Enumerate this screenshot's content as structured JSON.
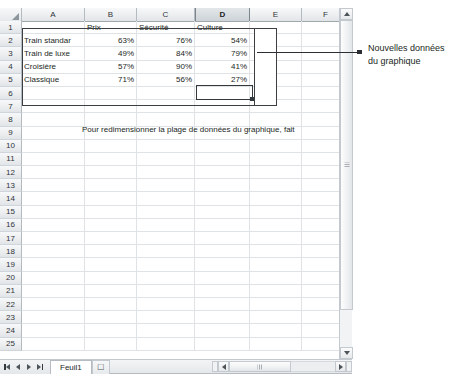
{
  "app": {
    "name": "Microsoft Excel worksheet"
  },
  "grid": {
    "column_headers": [
      "A",
      "B",
      "C",
      "D",
      "E",
      "F"
    ],
    "selected_column": "D",
    "row_headers": [
      "1",
      "2",
      "3",
      "4",
      "5",
      "6",
      "7",
      "8",
      "9",
      "10",
      "11",
      "12",
      "13",
      "14",
      "15",
      "16",
      "17",
      "18",
      "19",
      "20",
      "21",
      "22",
      "23",
      "24",
      "25"
    ],
    "header_row": {
      "A": "",
      "B": "Prix",
      "C": "Sécurité",
      "D": "Culture",
      "E": "",
      "F": ""
    },
    "rows": [
      {
        "row": "2",
        "A": "Train standar",
        "B": "63%",
        "C": "76%",
        "D": "54%"
      },
      {
        "row": "3",
        "A": "Train de luxe",
        "B": "49%",
        "C": "84%",
        "D": "79%"
      },
      {
        "row": "4",
        "A": "Croisière",
        "B": "57%",
        "C": "90%",
        "D": "41%"
      },
      {
        "row": "5",
        "A": "Classique",
        "B": "71%",
        "C": "56%",
        "D": "27%"
      }
    ],
    "active_cell": "D5",
    "active_cell_value": "27%",
    "hint_text": "Pour redimensionner la plage de données du graphique, fait"
  },
  "tabbar": {
    "sheet_name": "Feuil1",
    "new_sheet_icon": "new-sheet-icon",
    "nav_first_icon": "nav-first-icon",
    "nav_prev_icon": "nav-prev-icon",
    "nav_next_icon": "nav-next-icon",
    "nav_last_icon": "nav-last-icon"
  },
  "scrollbars": {
    "v_up_icon": "scroll-up-icon",
    "v_down_icon": "scroll-down-icon",
    "h_left_icon": "scroll-left-icon",
    "h_right_icon": "scroll-right-icon"
  },
  "callout": {
    "line1": "Nouvelles données",
    "line2": "du graphique"
  },
  "colors": {
    "grid_line": "#dfe3e6",
    "header_text": "#30353a",
    "selection_border": "#33383d",
    "callout_text": "#1b1f24",
    "leader_line": "#2b2f33"
  }
}
